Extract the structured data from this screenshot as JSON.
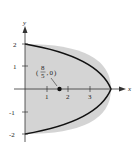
{
  "diagram": {
    "type": "region-plot",
    "curve": "x = 4 - y^2",
    "axes": {
      "x_label": "x",
      "y_label": "y",
      "x_ticks": [
        "1",
        "2",
        "3"
      ],
      "y_ticks": [
        "2",
        "1",
        "-1",
        "-2"
      ]
    },
    "point": {
      "label_num": "8",
      "label_den": "5",
      "label_y": "0",
      "x": 1.6,
      "y": 0
    },
    "colors": {
      "fill": "#d4d4d4",
      "curve": "#111111",
      "axis": "#333333"
    }
  }
}
